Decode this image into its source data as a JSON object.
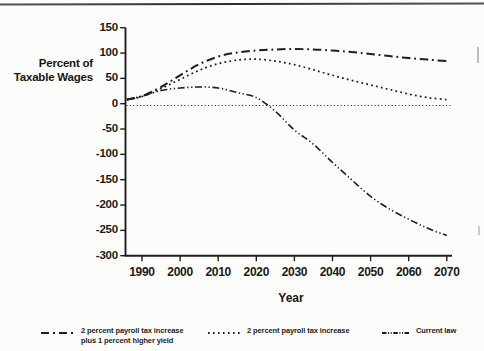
{
  "page": {
    "background": "#fcfcfa",
    "ink": "#1e1e1c"
  },
  "chart_data": {
    "type": "line",
    "title": "",
    "ylabel": "Percent of Taxable Wages",
    "ylabel_lines": [
      "Percent of",
      "Taxable Wages"
    ],
    "xlabel": "Year",
    "x": [
      1986,
      1990,
      1995,
      2000,
      2005,
      2010,
      2015,
      2020,
      2025,
      2030,
      2035,
      2040,
      2045,
      2050,
      2055,
      2060,
      2065,
      2070
    ],
    "series": [
      {
        "name": "2 percent payroll tax increase plus 1 percent higher yield",
        "style": "dashdot",
        "values": [
          8,
          15,
          33,
          56,
          78,
          93,
          101,
          105,
          107,
          108,
          107,
          105,
          102,
          98,
          94,
          90,
          87,
          84
        ]
      },
      {
        "name": "2 percent payroll tax increase",
        "style": "dotted",
        "values": [
          8,
          14,
          30,
          48,
          66,
          79,
          86,
          88,
          84,
          77,
          67,
          56,
          46,
          37,
          28,
          19,
          12,
          8
        ]
      },
      {
        "name": "Current law",
        "style": "dashdotdot",
        "values": [
          8,
          15,
          26,
          31,
          33,
          31,
          22,
          12,
          -15,
          -52,
          -80,
          -116,
          -150,
          -183,
          -208,
          -228,
          -246,
          -260
        ]
      }
    ],
    "y_ticks": [
      150,
      100,
      50,
      0,
      -50,
      -100,
      -150,
      -200,
      -250,
      -300
    ],
    "x_ticks": [
      1990,
      2000,
      2010,
      2020,
      2030,
      2040,
      2050,
      2060,
      2070
    ],
    "ylim": [
      -300,
      150
    ],
    "xlim": [
      1985.5,
      2072
    ],
    "zero_reference_line": true,
    "grid": false,
    "legend_position": "bottom"
  },
  "legend": {
    "items": [
      {
        "line1": "2 percent payroll tax increase",
        "line2": "plus 1 percent higher yield",
        "style": "dashdot"
      },
      {
        "line1": "2 percent payroll tax increase",
        "line2": "",
        "style": "dotted"
      },
      {
        "line1": "Current law",
        "line2": "",
        "style": "dashdotdot"
      }
    ]
  }
}
